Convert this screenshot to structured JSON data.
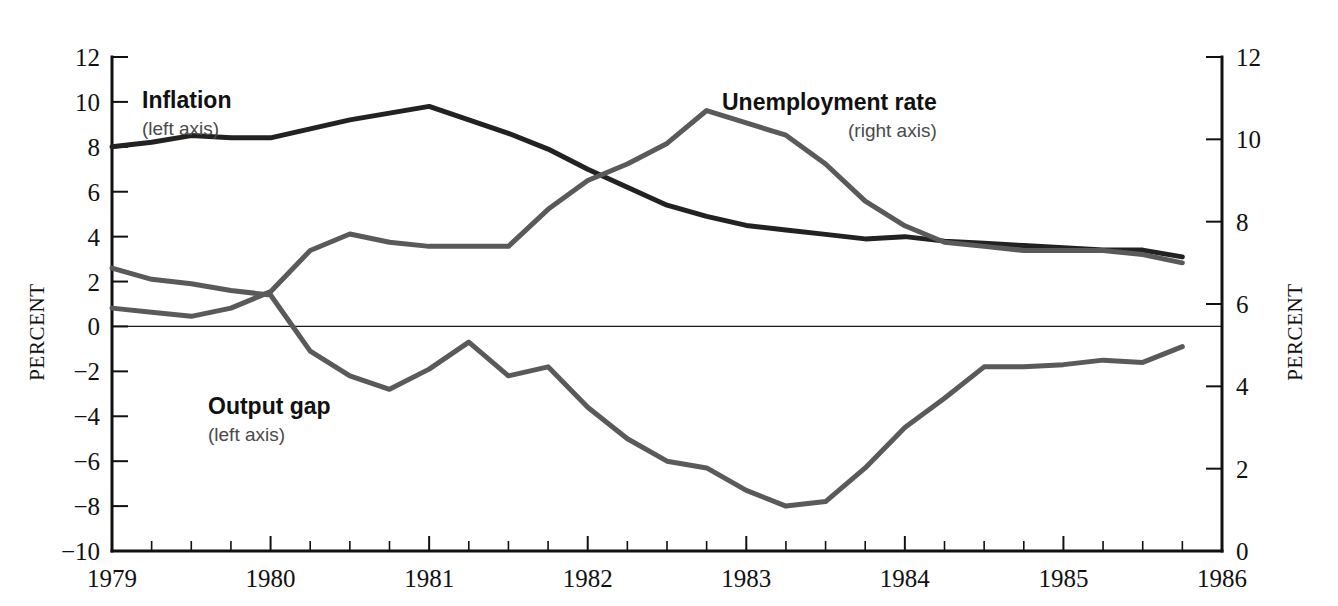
{
  "figure": {
    "width": 1338,
    "height": 606,
    "background": "#ffffff"
  },
  "colors": {
    "inflation": "#222222",
    "unemployment": "#5a5a5a",
    "output_gap": "#5a5a5a",
    "axis": "#111111",
    "zero_line": "#1a1a1a",
    "annotation_sub": "#4a4a4a"
  },
  "annotations": [
    {
      "name": "inflation",
      "title": "Inflation",
      "subtitle": "(left axis)",
      "x": 142,
      "y": 108
    },
    {
      "name": "unemployment",
      "title": "Unemployment rate",
      "subtitle": "(right axis)",
      "x": 722,
      "y": 110
    },
    {
      "name": "output-gap",
      "title": "Output gap",
      "subtitle": "(left axis)",
      "x": 208,
      "y": 414
    }
  ],
  "chart_data": {
    "type": "line",
    "title": "",
    "subtitle": "",
    "xlabel": "",
    "ylabel": "PERCENT",
    "y2label": "PERCENT",
    "grid": false,
    "legend": "inline-annotations",
    "x": [
      1979.0,
      1979.25,
      1979.5,
      1979.75,
      1980.0,
      1980.25,
      1980.5,
      1980.75,
      1981.0,
      1981.25,
      1981.5,
      1981.75,
      1982.0,
      1982.25,
      1982.5,
      1982.75,
      1983.0,
      1983.25,
      1983.5,
      1983.75,
      1984.0,
      1984.25,
      1984.5,
      1984.75,
      1985.0,
      1985.25,
      1985.5,
      1985.75
    ],
    "xtick_labels": [
      "1979",
      "1980",
      "1981",
      "1982",
      "1983",
      "1984",
      "1985",
      "1986"
    ],
    "xtick_values": [
      1979,
      1980,
      1981,
      1982,
      1983,
      1984,
      1985,
      1986
    ],
    "xlim": [
      1979,
      1986
    ],
    "x_minor_ticks_per_year": 4,
    "ytick_labels_left": [
      "12",
      "10",
      "8",
      "6",
      "4",
      "2",
      "0",
      "−2",
      "−4",
      "−6",
      "−8",
      "−10"
    ],
    "ytick_values_left": [
      12,
      10,
      8,
      6,
      4,
      2,
      0,
      -2,
      -4,
      -6,
      -8,
      -10
    ],
    "ylim_left": [
      -10,
      12
    ],
    "ytick_labels_right": [
      "12",
      "10",
      "8",
      "6",
      "4",
      "2",
      "0"
    ],
    "ytick_values_right": [
      12,
      10,
      8,
      6,
      4,
      2,
      0
    ],
    "ylim_right": [
      0,
      12
    ],
    "zero_line_left_value": 0,
    "series": [
      {
        "name": "Inflation",
        "axis": "left",
        "color": "#222222",
        "width": 5,
        "values": [
          8.0,
          8.2,
          8.5,
          8.4,
          8.4,
          8.8,
          9.2,
          9.5,
          9.8,
          9.2,
          8.6,
          7.9,
          7.0,
          6.2,
          5.4,
          4.9,
          4.5,
          4.3,
          4.1,
          3.9,
          4.0,
          3.8,
          3.7,
          3.6,
          3.5,
          3.4,
          3.4,
          3.1
        ]
      },
      {
        "name": "Unemployment rate",
        "axis": "right",
        "color": "#5a5a5a",
        "width": 5,
        "values": [
          5.9,
          5.8,
          5.7,
          5.9,
          6.3,
          7.3,
          7.7,
          7.5,
          7.4,
          7.4,
          7.4,
          8.3,
          9.0,
          9.4,
          9.9,
          10.7,
          10.4,
          10.1,
          9.4,
          8.5,
          7.9,
          7.5,
          7.4,
          7.3,
          7.3,
          7.3,
          7.2,
          7.0
        ]
      },
      {
        "name": "Output gap",
        "axis": "left",
        "color": "#5a5a5a",
        "width": 5,
        "values": [
          2.6,
          2.1,
          1.9,
          1.6,
          1.4,
          -1.1,
          -2.2,
          -2.8,
          -1.9,
          -0.7,
          -2.2,
          -1.8,
          -3.6,
          -5.0,
          -6.0,
          -6.3,
          -7.3,
          -8.0,
          -7.8,
          -6.3,
          -4.5,
          -3.2,
          -1.8,
          -1.8,
          -1.7,
          -1.5,
          -1.6,
          -0.9
        ]
      }
    ]
  }
}
